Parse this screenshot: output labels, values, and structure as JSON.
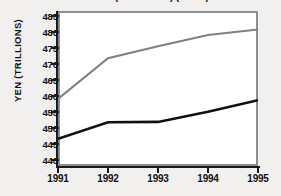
{
  "figure": {
    "background_color": "#f1f0ee",
    "plot_background": "#ffffff",
    "plot_border_color": "#8e8e8e",
    "axis_color": "#1b1b1b"
  },
  "title": {
    "text": "GDP (at 1990 Yen) ( 1995 )",
    "visible_fragment": "clipped at top edge"
  },
  "yaxis": {
    "label": "YEN (TRILLIONS)",
    "ticks": [
      485,
      480,
      475,
      470,
      465,
      460,
      455,
      450,
      445,
      440
    ],
    "min": 438,
    "max": 486.5
  },
  "xaxis": {
    "label": "",
    "ticks": [
      "1991",
      "1992",
      "1993",
      "1994",
      "1995"
    ]
  },
  "chart_data": {
    "type": "line",
    "title": "GDP (at 1990 Yen) ( 1995 )",
    "xlabel": "",
    "ylabel": "YEN (TRILLIONS)",
    "categories": [
      "1991",
      "1992",
      "1993",
      "1994",
      "1995"
    ],
    "x": [
      1991,
      1992,
      1993,
      1994,
      1995
    ],
    "ylim": [
      438,
      486.5
    ],
    "yticks": [
      440,
      445,
      450,
      455,
      460,
      465,
      470,
      475,
      480,
      485
    ],
    "grid": false,
    "legend": "none",
    "series": [
      {
        "name": "gray-series",
        "color": "#808080",
        "line_width": 2.1,
        "values": [
          459.0,
          471.7,
          475.5,
          479.0,
          480.7
        ]
      },
      {
        "name": "black-series",
        "color": "#101010",
        "line_width": 2.6,
        "values": [
          446.5,
          451.7,
          451.8,
          455.0,
          458.6
        ]
      }
    ]
  }
}
